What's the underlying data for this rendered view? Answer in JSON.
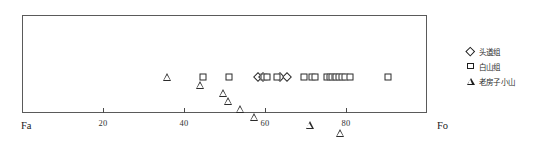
{
  "chart_data": {
    "type": "scatter",
    "title": "",
    "xlabel": "",
    "ylabel": "",
    "xlim": [
      0,
      100
    ],
    "grid": false,
    "axis_start_label": "Fa",
    "axis_end_label": "Fo",
    "xticks": [
      20,
      40,
      60,
      80
    ],
    "xtick_labels": [
      "20",
      "40",
      "60",
      "80"
    ],
    "legend_position": "right",
    "series": [
      {
        "name": "头道组",
        "marker": "diamond",
        "values": [
          58.2,
          59.4,
          63.8,
          65.4
        ]
      },
      {
        "name": "白山组",
        "marker": "square",
        "values": [
          44.6,
          51.2,
          59.8,
          60.6,
          63.0,
          69.6,
          71.6,
          72.4,
          75.2,
          76.0,
          76.6,
          77.2,
          77.6,
          78.2,
          79.0,
          79.8,
          81.0,
          90.4
        ]
      },
      {
        "name": "老房子小山",
        "marker": "triangle",
        "values": [
          35.8,
          44.0,
          49.6,
          50.8,
          53.8,
          57.2,
          71.0,
          78.6
        ]
      }
    ]
  },
  "legend": {
    "items": [
      {
        "label": "头道组",
        "marker": "diamond"
      },
      {
        "label": "白山组",
        "marker": "square"
      },
      {
        "label": "老房子小山",
        "marker": "triangle"
      }
    ]
  }
}
